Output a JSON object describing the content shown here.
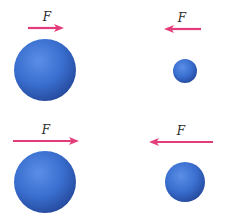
{
  "diagram": {
    "colors": {
      "background": "#ffffff",
      "arrow": "#e23d7a",
      "sphere_light": "#5b8ee6",
      "sphere_mid": "#3a6fd0",
      "sphere_dark": "#24489a",
      "label": "#2a2a2a"
    },
    "panels": [
      {
        "id": "top-left",
        "force_label": "F",
        "direction": "right",
        "arrow": {
          "x1": 28,
          "x2": 64,
          "y": 28
        },
        "label_pos": {
          "x": 47,
          "y": 21
        },
        "sphere": {
          "cx": 45,
          "cy": 70,
          "r": 31,
          "size": "large"
        }
      },
      {
        "id": "top-right",
        "force_label": "F",
        "direction": "left",
        "arrow": {
          "x1": 201,
          "x2": 164,
          "y": 29
        },
        "label_pos": {
          "x": 182,
          "y": 22
        },
        "sphere": {
          "cx": 185,
          "cy": 71,
          "r": 12,
          "size": "small"
        }
      },
      {
        "id": "bottom-left",
        "force_label": "F",
        "direction": "right",
        "arrow": {
          "x1": 13,
          "x2": 79,
          "y": 141
        },
        "label_pos": {
          "x": 46,
          "y": 134
        },
        "sphere": {
          "cx": 45,
          "cy": 182,
          "r": 31,
          "size": "large"
        }
      },
      {
        "id": "bottom-right",
        "force_label": "F",
        "direction": "left",
        "arrow": {
          "x1": 213,
          "x2": 149,
          "y": 142
        },
        "label_pos": {
          "x": 181,
          "y": 135
        },
        "sphere": {
          "cx": 185,
          "cy": 182,
          "r": 20,
          "size": "medium"
        }
      }
    ]
  }
}
